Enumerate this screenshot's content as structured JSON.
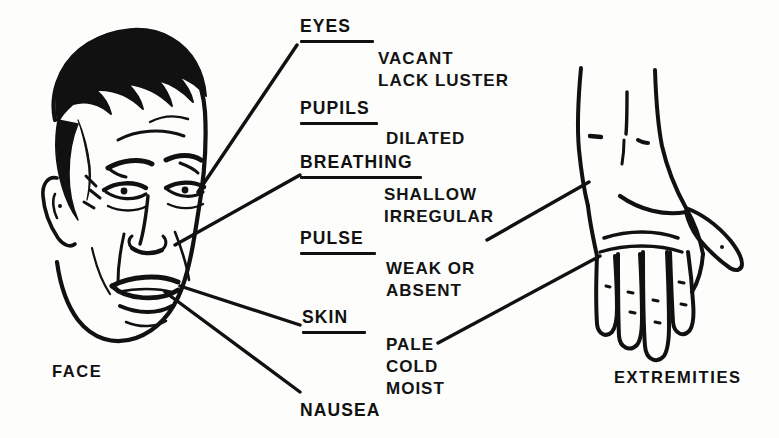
{
  "diagram": {
    "ink_color": "#111111",
    "background_color": "#fdfdfc"
  },
  "figures": [
    {
      "name": "face",
      "caption": "FACE"
    },
    {
      "name": "hand",
      "caption": "EXTREMITIES"
    }
  ],
  "captions": {
    "face": "FACE",
    "extremities": "EXTREMITIES"
  },
  "signs": [
    {
      "heading": "EYES",
      "underlined": true,
      "details": [
        "VACANT",
        "LACK LUSTER"
      ]
    },
    {
      "heading": "PUPILS",
      "underlined": true,
      "details": [
        "DILATED"
      ]
    },
    {
      "heading": "BREATHING",
      "underlined": true,
      "details": [
        "SHALLOW",
        "IRREGULAR"
      ]
    },
    {
      "heading": "PULSE",
      "underlined": true,
      "details": [
        "WEAK OR",
        "ABSENT"
      ]
    },
    {
      "heading": "SKIN",
      "underlined": true,
      "details": [
        "PALE",
        "COLD",
        "MOIST"
      ]
    },
    {
      "heading": "NAUSEA",
      "underlined": false,
      "details": []
    }
  ],
  "sign_text": {
    "eyes": {
      "heading": "EYES",
      "line1": "VACANT",
      "line2": "LACK LUSTER"
    },
    "pupils": {
      "heading": "PUPILS",
      "line1": "DILATED"
    },
    "breathing": {
      "heading": "BREATHING",
      "line1": "SHALLOW",
      "line2": "IRREGULAR"
    },
    "pulse": {
      "heading": "PULSE",
      "line1": "WEAK OR",
      "line2": "ABSENT"
    },
    "skin": {
      "heading": "SKIN",
      "line1": "PALE",
      "line2": "COLD",
      "line3": "MOIST"
    },
    "nausea": {
      "heading": "NAUSEA"
    }
  },
  "leader_lines": [
    {
      "from": "eyes-heading",
      "to": "face-eye-region"
    },
    {
      "from": "breathing-heading",
      "to": "face-nose-region"
    },
    {
      "from": "pulse-heading",
      "to": "hand-wrist"
    },
    {
      "from": "skin-heading",
      "to": "face-cheek"
    },
    {
      "from": "skin-details",
      "to": "hand-fingers"
    },
    {
      "from": "nausea-heading",
      "to": "face-mouth"
    }
  ]
}
